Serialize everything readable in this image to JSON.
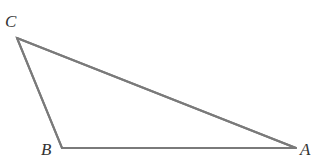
{
  "diagram": {
    "type": "triangle",
    "vertices": {
      "A": {
        "label": "A",
        "x": 296,
        "y": 148
      },
      "B": {
        "label": "B",
        "x": 62,
        "y": 148
      },
      "C": {
        "label": "C",
        "x": 17,
        "y": 38
      }
    },
    "edges": [
      {
        "from": "C",
        "to": "B"
      },
      {
        "from": "B",
        "to": "A"
      },
      {
        "from": "A",
        "to": "C"
      }
    ],
    "colors": {
      "edge": "#7a7a7a",
      "label": "#333333",
      "background": "#ffffff"
    }
  }
}
